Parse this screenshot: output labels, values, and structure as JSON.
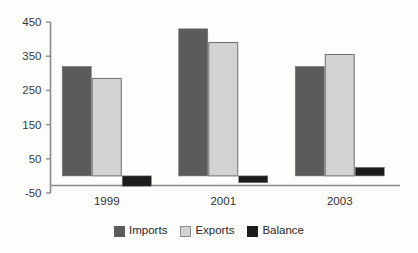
{
  "chart_data": {
    "type": "bar",
    "title": "",
    "subtitle": "",
    "xlabel": "",
    "ylabel": "",
    "categories": [
      "1999",
      "2001",
      "2003"
    ],
    "series": [
      {
        "name": "Imports",
        "values": [
          320,
          430,
          320
        ],
        "color": "#5b5b5b"
      },
      {
        "name": "Exports",
        "values": [
          285,
          390,
          355
        ],
        "color": "#d2d2d2"
      },
      {
        "name": "Balance",
        "values": [
          -30,
          -20,
          25
        ],
        "color": "#1c1c1c"
      }
    ],
    "ylim": [
      -50,
      450
    ],
    "yticks": [
      -50,
      50,
      150,
      250,
      350,
      450
    ],
    "ytick_labels": [
      "-50",
      "50",
      "150",
      "250",
      "350",
      "450"
    ],
    "grid": false,
    "legend_position": "bottom",
    "axis_color": "#8a8a8a",
    "bar_edge_color": "#6f6f6f"
  },
  "legend": {
    "items": [
      {
        "label": "Imports",
        "color": "#5b5b5b",
        "icon": "square-swatch-icon"
      },
      {
        "label": "Exports",
        "color": "#d2d2d2",
        "icon": "square-swatch-icon"
      },
      {
        "label": "Balance",
        "color": "#1c1c1c",
        "icon": "square-swatch-icon"
      }
    ]
  }
}
